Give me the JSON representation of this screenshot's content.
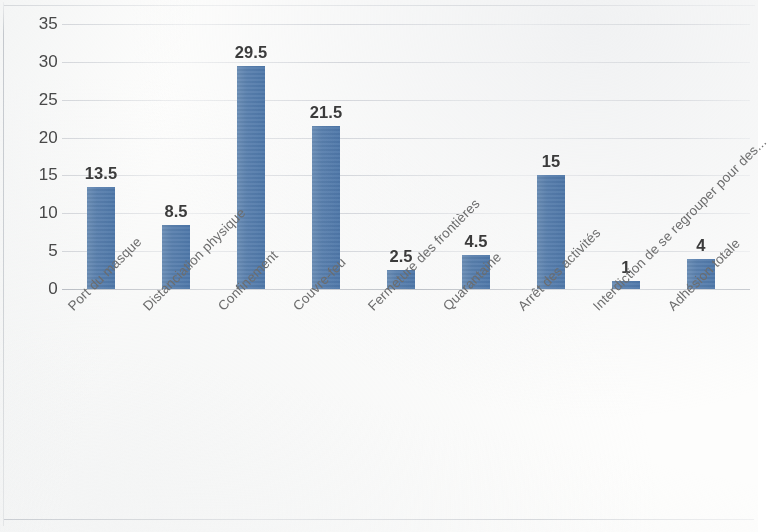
{
  "chart_data": {
    "type": "bar",
    "title": "",
    "subtitle": "",
    "xlabel": "",
    "ylabel": "",
    "categories": [
      "Port du masque",
      "Distanciation physique",
      "Confinement",
      "Couvre-feu",
      "Fermeture des frontières",
      "Quarantaine",
      "Arrêt des activités",
      "Interdiction de se regrouper pour des...",
      "Adhésion totale"
    ],
    "values": [
      13.5,
      8.5,
      29.5,
      21.5,
      2.5,
      4.5,
      15,
      1,
      4
    ],
    "value_labels": [
      "13.5",
      "8.5",
      "29.5",
      "21.5",
      "2.5",
      "4.5",
      "15",
      "1",
      "4"
    ],
    "ylim": [
      0,
      35
    ],
    "ytick_values": [
      0,
      5,
      10,
      15,
      20,
      25,
      30,
      35
    ],
    "ytick_labels": [
      "0",
      "5",
      "10",
      "15",
      "20",
      "25",
      "30",
      "35"
    ],
    "grid": true,
    "grid_axis": "y",
    "legend": false,
    "legend_position": "none",
    "series": [
      {
        "name": "",
        "values": [
          13.5,
          8.5,
          29.5,
          21.5,
          2.5,
          4.5,
          15,
          1,
          4
        ],
        "color": "#5b82b0"
      }
    ],
    "label_rotation_deg": -45,
    "colors": {
      "bar": "#5b82b0",
      "gridline": "#d0d3d8",
      "axis_text": "#4a4a4a",
      "category_text": "#6e6e6e",
      "value_text": "#3c3c3c",
      "background": "#fdfdfc"
    }
  }
}
